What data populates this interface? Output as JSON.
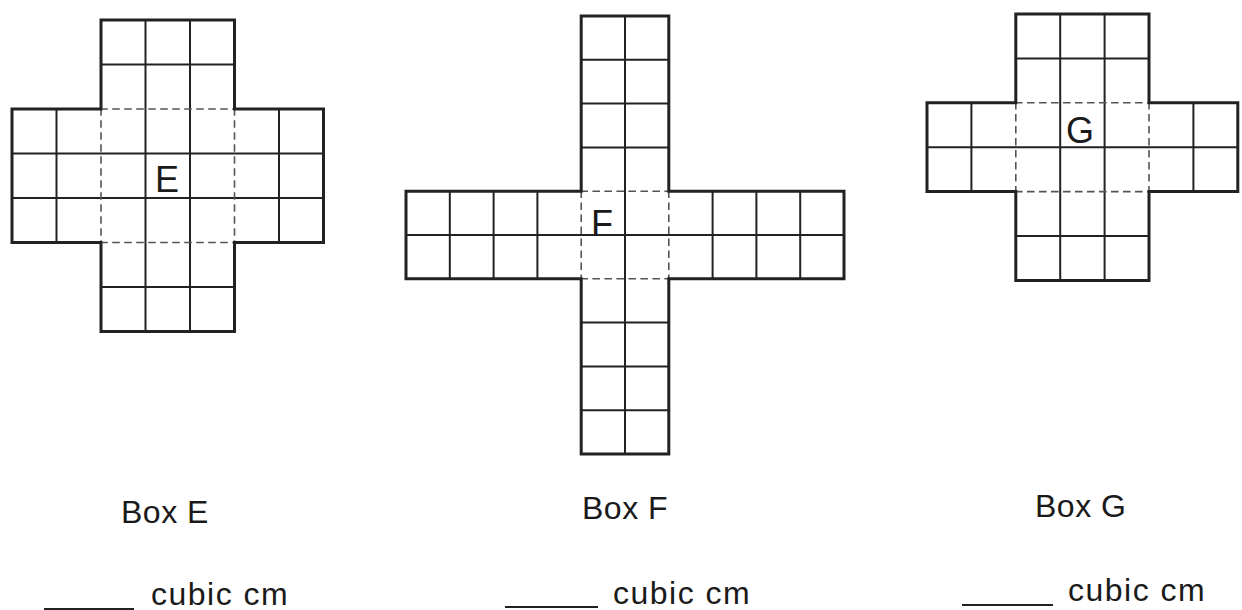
{
  "boxes": [
    {
      "id": "E",
      "letter": "E",
      "label": "Box E",
      "unit": "cubic cm",
      "answer": "",
      "net": {
        "origin": [
          12,
          20
        ],
        "cell": 44.5,
        "center": {
          "col": 2,
          "row": 2,
          "w": 3,
          "h": 3
        },
        "arms": {
          "top": {
            "w": 3,
            "len": 2
          },
          "bottom": {
            "w": 3,
            "len": 2
          },
          "left": {
            "w": 3,
            "len": 2
          },
          "right": {
            "w": 3,
            "len": 2
          }
        },
        "letter_pos": [
          155,
          162
        ]
      },
      "label_pos": [
        121,
        496
      ],
      "blank": {
        "x": 44,
        "y": 608,
        "w": 90
      },
      "unit_pos": [
        151,
        578
      ]
    },
    {
      "id": "F",
      "letter": "F",
      "label": "Box F",
      "unit": "cubic cm",
      "answer": "",
      "net": {
        "origin": [
          406,
          16
        ],
        "cell": 43.8,
        "center": {
          "col": 4,
          "row": 4,
          "w": 2,
          "h": 2
        },
        "arms": {
          "top": {
            "w": 2,
            "len": 4
          },
          "bottom": {
            "w": 2,
            "len": 4
          },
          "left": {
            "w": 2,
            "len": 4
          },
          "right": {
            "w": 2,
            "len": 4
          }
        },
        "letter_pos": [
          591,
          206
        ]
      },
      "label_pos": [
        582,
        492
      ],
      "blank": {
        "x": 505,
        "y": 606,
        "w": 93
      },
      "unit_pos": [
        613,
        577
      ]
    },
    {
      "id": "G",
      "letter": "G",
      "label": "Box G",
      "unit": "cubic cm",
      "answer": "",
      "net": {
        "origin": [
          927,
          14
        ],
        "cell": 44.4,
        "center": {
          "col": 2,
          "row": 2,
          "w": 3,
          "h": 2
        },
        "arms": {
          "top": {
            "w": 3,
            "len": 2
          },
          "bottom": {
            "w": 3,
            "len": 2
          },
          "left": {
            "w": 2,
            "len": 2
          },
          "right": {
            "w": 2,
            "len": 2
          }
        },
        "letter_pos": [
          1066,
          113
        ]
      },
      "label_pos": [
        1035,
        490
      ],
      "blank": {
        "x": 962,
        "y": 604,
        "w": 91
      },
      "unit_pos": [
        1068,
        574
      ]
    }
  ],
  "colors": {
    "line": "#222222",
    "dash": "#555555",
    "text": "#1a1a1a"
  }
}
